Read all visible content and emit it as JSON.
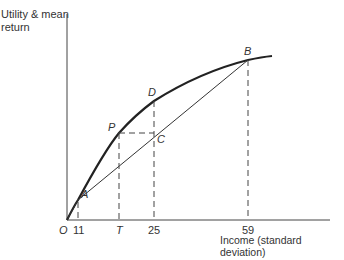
{
  "diagram": {
    "y_axis_label_line1": "Utility & mean",
    "y_axis_label_line2": "return",
    "x_axis_label": "Income (standard deviation)",
    "x_ticks": {
      "origin": "O",
      "t1": "11",
      "t2": "T",
      "t3": "25",
      "t4": "59"
    },
    "points": {
      "A": "A",
      "P": "P",
      "C": "C",
      "D": "D",
      "B": "B"
    },
    "colors": {
      "curve": "#222222",
      "line": "#333333"
    }
  }
}
